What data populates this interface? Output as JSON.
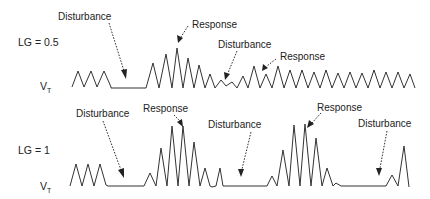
{
  "panels": [
    {
      "id": "lg-0.5",
      "gain_label": "LG = 0.5",
      "signal_label": "V",
      "signal_subscript": "T",
      "annotations": [
        {
          "text": "Disturbance",
          "kind": "disturbance"
        },
        {
          "text": "Response",
          "kind": "response"
        },
        {
          "text": "Disturbance",
          "kind": "disturbance"
        },
        {
          "text": "Response",
          "kind": "response"
        }
      ]
    },
    {
      "id": "lg-1",
      "gain_label": "LG = 1",
      "signal_label": "V",
      "signal_subscript": "T",
      "annotations": [
        {
          "text": "Disturbance",
          "kind": "disturbance"
        },
        {
          "text": "Response",
          "kind": "response"
        },
        {
          "text": "Disturbance",
          "kind": "disturbance"
        },
        {
          "text": "Response",
          "kind": "response"
        },
        {
          "text": "Disturbance",
          "kind": "disturbance"
        }
      ]
    }
  ]
}
